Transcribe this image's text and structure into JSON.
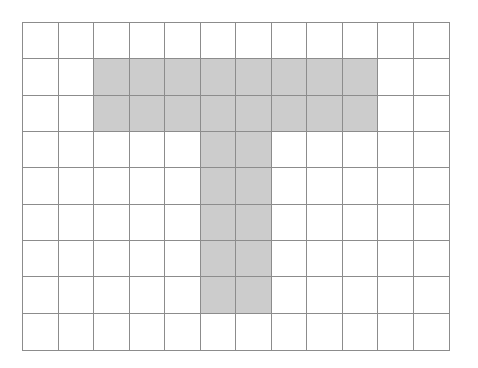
{
  "grid": {
    "rows": 9,
    "cols": 12,
    "colors": {
      "shaded": "#cccccc",
      "empty": "#ffffff",
      "line": "#8c8c8c"
    },
    "shape": "T",
    "shaded_cells": [
      [
        1,
        2
      ],
      [
        1,
        3
      ],
      [
        1,
        4
      ],
      [
        1,
        5
      ],
      [
        1,
        6
      ],
      [
        1,
        7
      ],
      [
        1,
        8
      ],
      [
        1,
        9
      ],
      [
        2,
        2
      ],
      [
        2,
        3
      ],
      [
        2,
        4
      ],
      [
        2,
        5
      ],
      [
        2,
        6
      ],
      [
        2,
        7
      ],
      [
        2,
        8
      ],
      [
        2,
        9
      ],
      [
        3,
        5
      ],
      [
        3,
        6
      ],
      [
        4,
        5
      ],
      [
        4,
        6
      ],
      [
        5,
        5
      ],
      [
        5,
        6
      ],
      [
        6,
        5
      ],
      [
        6,
        6
      ],
      [
        7,
        5
      ],
      [
        7,
        6
      ]
    ]
  }
}
